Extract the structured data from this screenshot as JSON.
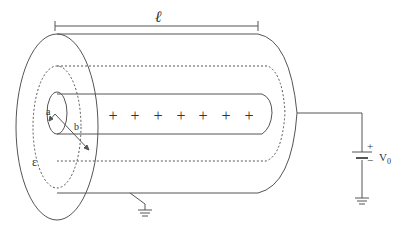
{
  "diagram": {
    "labels": {
      "length": "ℓ",
      "inner_radius": "a",
      "outer_radius": "b",
      "permittivity": "ε",
      "voltage": "V",
      "voltage_subscript": "0",
      "battery_plus": "+",
      "battery_minus": "−"
    },
    "charges": [
      "+",
      "+",
      "+",
      "+",
      "+",
      "+",
      "+"
    ],
    "colors": {
      "stroke": "#555555",
      "text": "#333333",
      "background": "#ffffff"
    }
  }
}
